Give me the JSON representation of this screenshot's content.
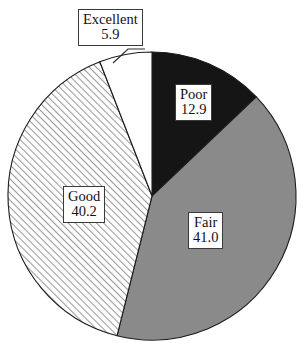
{
  "chart_data": {
    "type": "pie",
    "title": "",
    "subtitle": "",
    "xlabel": "",
    "ylabel": "",
    "legend": "none",
    "grid": false,
    "value_suffix": "",
    "total": 100.0,
    "start_angle_deg": 0,
    "direction": "clockwise",
    "categories": [
      "Poor",
      "Fair",
      "Good",
      "Excellent"
    ],
    "values": [
      12.9,
      41.0,
      40.2,
      5.9
    ],
    "slices": [
      {
        "label": "Poor",
        "value": "12.9",
        "value_num": 12.9,
        "fill": "#151515",
        "pattern": "solid",
        "angle_deg": 46.4
      },
      {
        "label": "Fair",
        "value": "41.0",
        "value_num": 41.0,
        "fill": "#8a8a8a",
        "pattern": "solid",
        "angle_deg": 147.6
      },
      {
        "label": "Good",
        "value": "40.2",
        "value_num": 40.2,
        "fill": "#ffffff",
        "pattern": "diagonal-hatch",
        "angle_deg": 144.7
      },
      {
        "label": "Excellent",
        "value": "5.9",
        "value_num": 5.9,
        "fill": "#ffffff",
        "pattern": "solid",
        "angle_deg": 21.2
      }
    ],
    "colors": {
      "poor": "#151515",
      "fair": "#8a8a8a",
      "good_hatch_line": "#9a9a9a",
      "good_background": "#ffffff",
      "excellent": "#ffffff",
      "outline": "#1c1c1c",
      "label_border": "#3a3a3a",
      "label_text": "#111111",
      "page_background": "#ffffff"
    },
    "geometry": {
      "center_x": 152,
      "center_y": 196,
      "radius": 144
    }
  }
}
